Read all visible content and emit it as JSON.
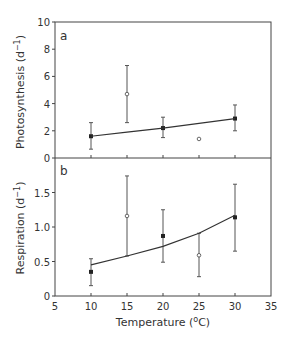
{
  "chart_data": [
    {
      "type": "line",
      "panel_label": "a",
      "title": "",
      "xlabel": "",
      "ylabel": "Photosynthesis (d−1)",
      "xlim": [
        5,
        35
      ],
      "ylim": [
        0,
        10
      ],
      "yticks": [
        "0",
        "2",
        "4",
        "6",
        "8",
        "10"
      ],
      "grid": false,
      "series": [
        {
          "name": "measured (filled)",
          "marker": "filled-square",
          "x": [
            10,
            20,
            30
          ],
          "y": [
            1.6,
            2.2,
            2.9
          ],
          "err_low": [
            0.65,
            1.5,
            2.0
          ],
          "err_high": [
            2.6,
            3.0,
            3.9
          ]
        },
        {
          "name": "measured (open)",
          "marker": "open-circle",
          "x": [
            15,
            25
          ],
          "y": [
            4.7,
            1.4
          ],
          "err_low": [
            2.6,
            null
          ],
          "err_high": [
            6.8,
            null
          ]
        },
        {
          "name": "fit",
          "type": "line",
          "x": [
            10,
            15,
            20,
            25,
            30
          ],
          "y": [
            1.6,
            1.9,
            2.2,
            2.55,
            2.9
          ]
        }
      ]
    },
    {
      "type": "line",
      "panel_label": "b",
      "title": "",
      "xlabel": "Temperature (oC)",
      "ylabel": "Respiration (d−1)",
      "xlim": [
        5,
        35
      ],
      "ylim": [
        0,
        2
      ],
      "xticks": [
        "5",
        "10",
        "15",
        "20",
        "25",
        "30",
        "35"
      ],
      "yticks": [
        "0",
        "0.5",
        "1.0",
        "1.5"
      ],
      "grid": false,
      "series": [
        {
          "name": "measured (filled)",
          "marker": "filled-square",
          "x": [
            10,
            20,
            30
          ],
          "y": [
            0.35,
            0.87,
            1.14
          ],
          "err_low": [
            0.15,
            0.49,
            0.65
          ],
          "err_high": [
            0.54,
            1.25,
            1.62
          ]
        },
        {
          "name": "measured (open)",
          "marker": "open-circle",
          "x": [
            15,
            25
          ],
          "y": [
            1.16,
            0.59
          ],
          "err_low": [
            0.58,
            0.28
          ],
          "err_high": [
            1.74,
            0.91
          ]
        },
        {
          "name": "fit",
          "type": "line",
          "x": [
            10,
            15,
            20,
            25,
            30
          ],
          "y": [
            0.45,
            0.58,
            0.72,
            0.91,
            1.17
          ]
        }
      ]
    }
  ],
  "labels": {
    "panel_a": "a",
    "panel_b": "b",
    "ylabel_a": "Photosynthesis (d",
    "ylabel_b": "Respiration (d",
    "ylabel_sup": "−1",
    "ylabel_close": ")",
    "xlabel_pre": "Temperature (",
    "xlabel_sup": "o",
    "xlabel_post": "C)"
  }
}
